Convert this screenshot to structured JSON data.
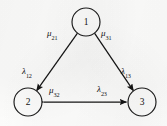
{
  "diagram": {
    "type": "state-transition-graph",
    "stroke_color": "#141414",
    "background_color": "#fdfdfc",
    "nodes": [
      {
        "id": "1",
        "label": "1",
        "cx": 86,
        "cy": 22,
        "r": 14
      },
      {
        "id": "2",
        "label": "2",
        "cx": 28,
        "cy": 102,
        "r": 14
      },
      {
        "id": "3",
        "label": "3",
        "cx": 142,
        "cy": 102,
        "r": 14
      }
    ],
    "edges": [
      {
        "id": "edge-1-2",
        "from": "1",
        "to": "2",
        "style": "double-headed-arrow",
        "labels": [
          {
            "name": "mu-21",
            "greek": "μ",
            "sub": "21",
            "x": 49,
            "y": 30
          },
          {
            "name": "lambda-12",
            "greek": "λ",
            "sub": "12",
            "x": 23,
            "y": 68
          }
        ]
      },
      {
        "id": "edge-1-3",
        "from": "1",
        "to": "3",
        "style": "double-headed-arrow",
        "labels": [
          {
            "name": "mu-31",
            "greek": "μ",
            "sub": "31",
            "x": 102,
            "y": 30
          },
          {
            "name": "lambda-13",
            "greek": "λ",
            "sub": "13",
            "x": 122,
            "y": 68
          }
        ]
      },
      {
        "id": "edge-2-3",
        "from": "2",
        "to": "3",
        "style": "double-headed-arrow",
        "labels": [
          {
            "name": "mu-32",
            "greek": "μ",
            "sub": "32",
            "x": 50,
            "y": 86
          },
          {
            "name": "lambda-23",
            "greek": "λ",
            "sub": "23",
            "x": 98,
            "y": 85
          }
        ]
      }
    ],
    "labels": {
      "mu_21": "μ",
      "mu_21_sub": "21",
      "mu_31": "μ",
      "mu_31_sub": "31",
      "mu_32": "μ",
      "mu_32_sub": "32",
      "lambda_12": "λ",
      "lambda_12_sub": "12",
      "lambda_13": "λ",
      "lambda_13_sub": "13",
      "lambda_23": "λ",
      "lambda_23_sub": "23"
    },
    "node_labels": {
      "n1": "1",
      "n2": "2",
      "n3": "3"
    }
  }
}
